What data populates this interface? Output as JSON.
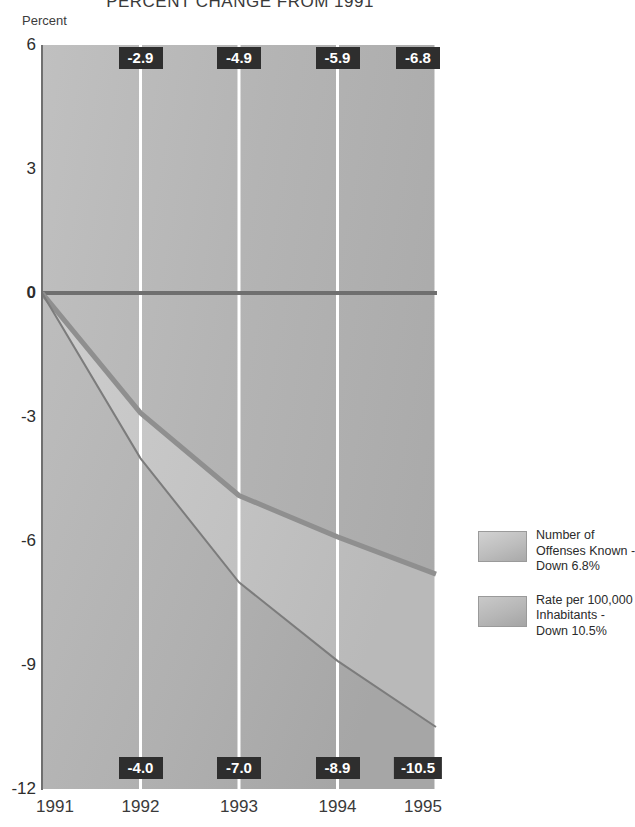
{
  "chart_data": {
    "type": "area",
    "title": "PERCENT CHANGE FROM 1991",
    "xlabel": "",
    "ylabel": "Percent",
    "x": [
      "1991",
      "1992",
      "1993",
      "1994",
      "1995"
    ],
    "categories": [
      "1991",
      "1992",
      "1993",
      "1994",
      "1995"
    ],
    "ylim": [
      -12,
      6
    ],
    "yticks": [
      "6",
      "3",
      "0",
      "-3",
      "-6",
      "-9",
      "-12"
    ],
    "ytick_values": [
      6,
      3,
      0,
      -3,
      -6,
      -9,
      -12
    ],
    "grid": true,
    "legend_position": "right",
    "series": [
      {
        "name": "Number of Offenses Known - Down 6.8%",
        "values": [
          0,
          -2.9,
          -4.9,
          -5.9,
          -6.8
        ],
        "labels": [
          "",
          "-2.9",
          "-4.9",
          "-5.9",
          "-6.8"
        ],
        "label_position": "top",
        "color": "#8f8f8f"
      },
      {
        "name": "Rate per 100,000 Inhabitants - Down 10.5%",
        "values": [
          0,
          -4.0,
          -7.0,
          -8.9,
          -10.5
        ],
        "labels": [
          "",
          "-4.0",
          "-7.0",
          "-8.9",
          "-10.5"
        ],
        "label_position": "bottom",
        "color": "#7c7c7c"
      }
    ],
    "colors": {
      "plot_background": "#b4b4b4",
      "between_fill": "#c3c3c3",
      "zero_line": "#6f6f6f",
      "gridline": "#ffffff",
      "callout_background": "#2e2e2e",
      "callout_text": "#ffffff",
      "axis": "#6f6f6f",
      "text": "#2d2d2d"
    }
  },
  "axis": {
    "y_label": "Percent",
    "y_ticks": [
      {
        "label": "6",
        "value": 6
      },
      {
        "label": "3",
        "value": 3
      },
      {
        "label": "0",
        "value": 0
      },
      {
        "label": "-3",
        "value": -3
      },
      {
        "label": "-6",
        "value": -6
      },
      {
        "label": "-9",
        "value": -9
      },
      {
        "label": "-12",
        "value": -12
      }
    ],
    "x_ticks": [
      {
        "label": "1991"
      },
      {
        "label": "1992"
      },
      {
        "label": "1993"
      },
      {
        "label": "1994"
      },
      {
        "label": "1995"
      }
    ]
  },
  "callouts": {
    "top": [
      "-2.9",
      "-4.9",
      "-5.9",
      "-6.8"
    ],
    "bottom": [
      "-4.0",
      "-7.0",
      "-8.9",
      "-10.5"
    ]
  },
  "legend": {
    "entries": [
      {
        "line1": "Number of",
        "line2": "Offenses Known -",
        "line3": "Down 6.8%"
      },
      {
        "line1": "Rate per 100,000",
        "line2": "Inhabitants -",
        "line3": "Down 10.5%"
      }
    ]
  }
}
